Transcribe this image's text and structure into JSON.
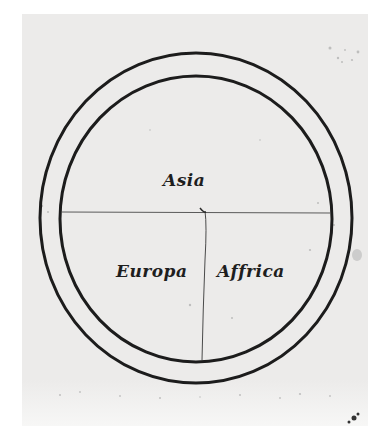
{
  "image": {
    "description": "Medieval T-O map manuscript drawing: two concentric circles divided into three continents",
    "background_color": "#ecebea",
    "ink_color": "#1e1e1e"
  },
  "map": {
    "labels": {
      "top": "Asia",
      "bottom_left": "Europa",
      "bottom_right": "Affrica"
    },
    "geometry": {
      "center": [
        196,
        218
      ],
      "outer_circle": {
        "rx": 156,
        "ry": 165
      },
      "inner_circle": {
        "rx": 136,
        "ry": 143
      },
      "horizontal_divider_y": 212,
      "vertical_divider_x": 204
    }
  }
}
